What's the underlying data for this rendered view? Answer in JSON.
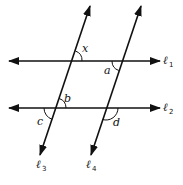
{
  "diagram": {
    "type": "parallel-lines-transversals",
    "lines": {
      "l1": {
        "label": "ℓ",
        "sub": "1",
        "orientation": "horizontal"
      },
      "l2": {
        "label": "ℓ",
        "sub": "2",
        "orientation": "horizontal"
      },
      "l3": {
        "label": "ℓ",
        "sub": "3",
        "orientation": "transversal"
      },
      "l4": {
        "label": "ℓ",
        "sub": "4",
        "orientation": "transversal"
      }
    },
    "angles": {
      "x": "x",
      "a": "a",
      "b": "b",
      "c": "c",
      "d": "d"
    },
    "colors": {
      "stroke": "#111111",
      "background": "#ffffff"
    }
  }
}
